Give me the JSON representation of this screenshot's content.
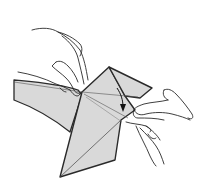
{
  "illustration": {
    "subject": "origami folding diagram with two hands",
    "paper_color": "#d9d9d9",
    "line_color": "#2a2a2a",
    "background": "#ffffff",
    "arrow": {
      "direction": "down",
      "meaning": "fold-direction"
    }
  }
}
